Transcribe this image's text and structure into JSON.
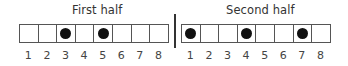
{
  "halves": [
    {
      "title": "First half",
      "cells": [
        {
          "label": "1",
          "filled": false
        },
        {
          "label": "2",
          "filled": false
        },
        {
          "label": "3",
          "filled": true
        },
        {
          "label": "4",
          "filled": false
        },
        {
          "label": "5",
          "filled": true
        },
        {
          "label": "6",
          "filled": false
        },
        {
          "label": "7",
          "filled": false
        },
        {
          "label": "8",
          "filled": false
        }
      ]
    },
    {
      "title": "Second half",
      "cells": [
        {
          "label": "1",
          "filled": true
        },
        {
          "label": "2",
          "filled": false
        },
        {
          "label": "3",
          "filled": false
        },
        {
          "label": "4",
          "filled": true
        },
        {
          "label": "5",
          "filled": false
        },
        {
          "label": "6",
          "filled": false
        },
        {
          "label": "7",
          "filled": true
        },
        {
          "label": "8",
          "filled": false
        }
      ]
    }
  ],
  "colors": {
    "dot": "#111111",
    "border": "#555555",
    "divider": "#333333"
  }
}
